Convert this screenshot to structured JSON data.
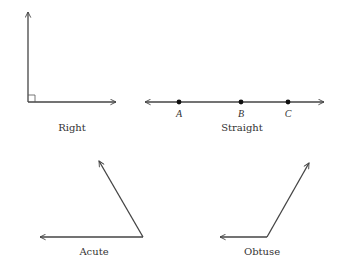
{
  "diagram": {
    "colors": {
      "line": "#444444",
      "text": "#333333",
      "background": "#ffffff"
    },
    "angles": [
      {
        "id": "right",
        "label": "Right",
        "vertex": [
          28,
          102
        ],
        "rays": [
          [
            28,
            12
          ],
          [
            116,
            102
          ]
        ],
        "right_angle_marker": true
      },
      {
        "id": "straight",
        "label": "Straight",
        "line": [
          [
            145,
            102
          ],
          [
            324,
            102
          ]
        ],
        "points": [
          {
            "name": "A",
            "x": 179
          },
          {
            "name": "B",
            "x": 241
          },
          {
            "name": "C",
            "x": 288
          }
        ]
      },
      {
        "id": "acute",
        "label": "Acute",
        "vertex": [
          143,
          237
        ],
        "rays": [
          [
            99,
            161
          ],
          [
            40,
            237
          ]
        ]
      },
      {
        "id": "obtuse",
        "label": "Obtuse",
        "vertex": [
          267,
          237
        ],
        "rays": [
          [
            309,
            163
          ],
          [
            220,
            237
          ]
        ]
      }
    ]
  }
}
